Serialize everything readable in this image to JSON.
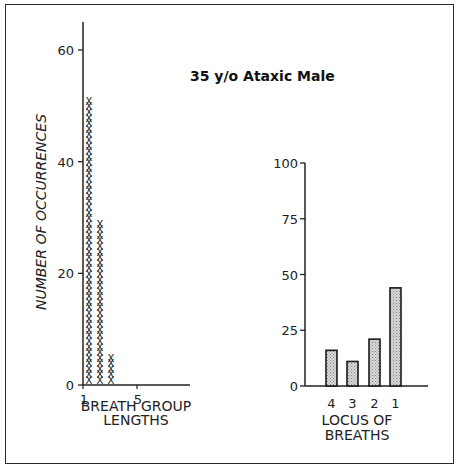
{
  "chart_data": [
    {
      "type": "scatter",
      "subtype": "tally-histogram",
      "title": "35 y/o Ataxic Male",
      "xlabel": "BREATH GROUP LENGTHS",
      "ylabel": "NUMBER OF OCCURRENCES",
      "x_ticks": [
        "1",
        "5"
      ],
      "y_ticks": [
        "0",
        "20",
        "40",
        "60"
      ],
      "ylim": [
        0,
        65
      ],
      "xlim": [
        1,
        9
      ],
      "categories": [
        1,
        2,
        3
      ],
      "values": [
        51,
        29,
        5
      ],
      "marker": "X",
      "grid": false
    },
    {
      "type": "bar",
      "title": "",
      "xlabel": "LOCUS OF BREATHS",
      "ylabel": "",
      "categories": [
        "4",
        "3",
        "2",
        "1"
      ],
      "values": [
        16,
        11,
        21,
        44
      ],
      "y_ticks": [
        "0",
        "25",
        "50",
        "75",
        "100"
      ],
      "ylim": [
        0,
        100
      ],
      "bar_fill": "#c8c8c8",
      "grid": false
    }
  ],
  "labels": {
    "title": "35 y/o Ataxic Male",
    "left_ylabel": "NUMBER OF OCCURRENCES",
    "left_xlabel_line1": "BREATH GROUP",
    "left_xlabel_line2": "LENGTHS",
    "right_xlabel_line1": "LOCUS OF",
    "right_xlabel_line2": "BREATHS",
    "left_yticks": [
      "0",
      "20",
      "40",
      "60"
    ],
    "left_xticks": [
      "1",
      "5"
    ],
    "right_yticks": [
      "0",
      "25",
      "50",
      "75",
      "100"
    ],
    "right_xticks": [
      "4",
      "3",
      "2",
      "1"
    ]
  }
}
